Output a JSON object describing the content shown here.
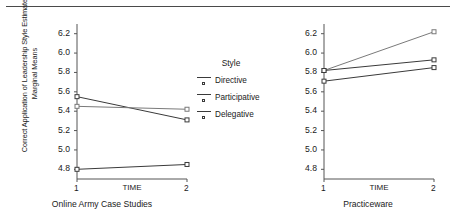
{
  "figure": {
    "top_rule": "horizontal-rule"
  },
  "legend": {
    "title": "Style",
    "entries": [
      {
        "label": "Directive"
      },
      {
        "label": "Participative"
      },
      {
        "label": "Delegative"
      }
    ]
  },
  "chart_data": [
    {
      "type": "line",
      "title": "",
      "caption": "Online Army Case Studies",
      "xlabel": "TIME",
      "ylabel": "Correct Application of Leadership Style Estimated Marginal Means",
      "x": [
        1,
        2
      ],
      "xticklabels": [
        "1",
        "2"
      ],
      "ylim": [
        4.7,
        6.3
      ],
      "yticks": [
        4.8,
        5.0,
        5.2,
        5.4,
        5.6,
        5.8,
        6.0,
        6.2
      ],
      "yticklabels": [
        "4.8",
        "5.0",
        "5.2",
        "5.4",
        "5.6",
        "5.8",
        "6.0",
        "6.2"
      ],
      "grid": false,
      "legend_position": "center-right-shared",
      "series": [
        {
          "name": "Directive",
          "values": [
            5.55,
            5.31
          ],
          "color": "#3a3a3a"
        },
        {
          "name": "Participative",
          "values": [
            5.45,
            5.42
          ],
          "color": "#7a7a7a"
        },
        {
          "name": "Delegative",
          "values": [
            4.8,
            4.85
          ],
          "color": "#3a3a3a"
        }
      ]
    },
    {
      "type": "line",
      "title": "",
      "caption": "Practiceware",
      "xlabel": "TIME",
      "ylabel": "",
      "x": [
        1,
        2
      ],
      "xticklabels": [
        "1",
        "2"
      ],
      "ylim": [
        4.7,
        6.3
      ],
      "yticks": [
        4.8,
        5.0,
        5.2,
        5.4,
        5.6,
        5.8,
        6.0,
        6.2
      ],
      "yticklabels": [
        "4.8",
        "5.0",
        "5.2",
        "5.4",
        "5.6",
        "5.8",
        "6.0",
        "6.2"
      ],
      "grid": false,
      "legend_position": "center-right-shared",
      "series": [
        {
          "name": "Directive",
          "values": [
            5.82,
            6.22
          ],
          "color": "#7a7a7a"
        },
        {
          "name": "Participative",
          "values": [
            5.82,
            5.93
          ],
          "color": "#3a3a3a"
        },
        {
          "name": "Delegative",
          "values": [
            5.71,
            5.85
          ],
          "color": "#3a3a3a"
        }
      ]
    }
  ]
}
